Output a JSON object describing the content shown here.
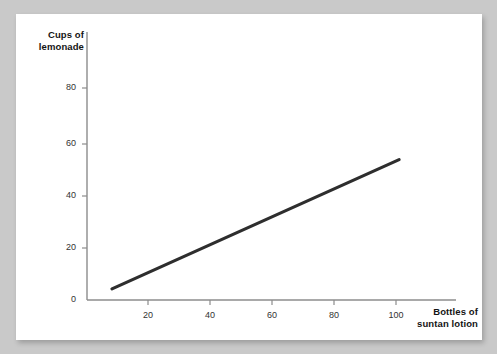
{
  "chart_data": {
    "type": "line",
    "title": "",
    "xlabel": "Bottles of suntan lotion",
    "ylabel": "Cups of lemonade",
    "xlim": [
      0,
      115
    ],
    "ylim": [
      0,
      92
    ],
    "grid": false,
    "legend": null,
    "x_ticks": [
      20,
      40,
      60,
      80,
      100
    ],
    "y_ticks": [
      0,
      20,
      40,
      60,
      80
    ],
    "line_color": "#2e2e2e",
    "series": [
      {
        "name": "lemonade vs suntan lotion",
        "x": [
          8.4,
          101
        ],
        "values": [
          4.2,
          53
        ]
      }
    ]
  },
  "axis": {
    "y_title_line1": "Cups of",
    "y_title_line2": "lemonade",
    "x_title_line1": "Bottles of",
    "x_title_line2": "suntan lotion",
    "y_tick_0": "0",
    "y_tick_20": "20",
    "y_tick_40": "40",
    "y_tick_60": "60",
    "y_tick_80": "80",
    "x_tick_20": "20",
    "x_tick_40": "40",
    "x_tick_60": "60",
    "x_tick_80": "80",
    "x_tick_100": "100"
  }
}
